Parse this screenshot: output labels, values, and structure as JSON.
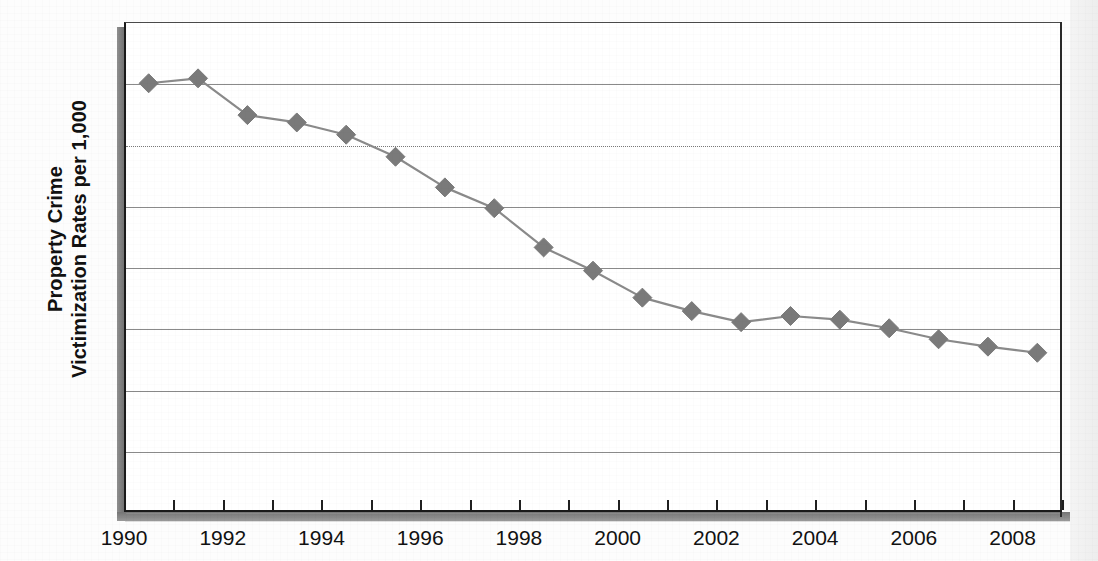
{
  "chart_data": {
    "type": "line",
    "title": "",
    "subtitle": "",
    "xlabel": "",
    "ylabel": "Property Crime Victimization Rates per 1,000",
    "ylabel_lines": [
      "Property Crime",
      "Victimization Rates per 1,000"
    ],
    "xlim": [
      1990,
      2009
    ],
    "ylim": [
      0,
      400
    ],
    "y_ticks": [
      0,
      50,
      100,
      150,
      200,
      250,
      300,
      350,
      400
    ],
    "y_tick_labels": [
      "0",
      "50",
      "100",
      "150",
      "200",
      "250",
      "300",
      "350",
      "400"
    ],
    "x_ticks": [
      1990,
      1992,
      1994,
      1996,
      1998,
      2000,
      2002,
      2004,
      2006,
      2008
    ],
    "x_tick_labels": [
      "1990",
      "1992",
      "1994",
      "1996",
      "1998",
      "2000",
      "2002",
      "2004",
      "2006",
      "2008"
    ],
    "x_minor_ticks": [
      1990,
      1991,
      1992,
      1993,
      1994,
      1995,
      1996,
      1997,
      1998,
      1999,
      2000,
      2001,
      2002,
      2003,
      2004,
      2005,
      2006,
      2007,
      2008,
      2009
    ],
    "grid": true,
    "grid_axis": "y",
    "dotted_gridline_value": 300,
    "legend": false,
    "legend_position": "none",
    "marker": "diamond",
    "series": [
      {
        "name": "Property crime victimization rate",
        "color": "#7a7a7a",
        "line_color": "#8a8a8a",
        "x": [
          1990.5,
          1991.5,
          1992.5,
          1993.5,
          1994.5,
          1995.5,
          1996.5,
          1997.5,
          1998.5,
          1999.5,
          2000.5,
          2001.5,
          2002.5,
          2003.5,
          2004.5,
          2005.5,
          2006.5,
          2007.5,
          2008.5
        ],
        "categories": [
          "1990",
          "1991",
          "1992",
          "1993",
          "1994",
          "1995",
          "1996",
          "1997",
          "1998",
          "1999",
          "2000",
          "2001",
          "2002",
          "2003",
          "2004",
          "2005",
          "2006",
          "2007",
          "2008"
        ],
        "values": [
          350,
          354,
          324,
          318,
          308,
          290,
          265,
          248,
          216,
          197,
          175,
          164,
          155,
          160,
          157,
          150,
          141,
          135,
          130
        ]
      }
    ]
  },
  "axes": {
    "y_title_line1": "Property Crime",
    "y_title_line2": "Victimization Rates per 1,000"
  },
  "colors": {
    "marker": "#7a7a7a",
    "line": "#8a8a8a",
    "gridline": "#8a8a8a",
    "axis": "#1a1a1a",
    "text": "#111111",
    "plot_background": "#ffffff",
    "page_background": "#fdfdfd"
  }
}
